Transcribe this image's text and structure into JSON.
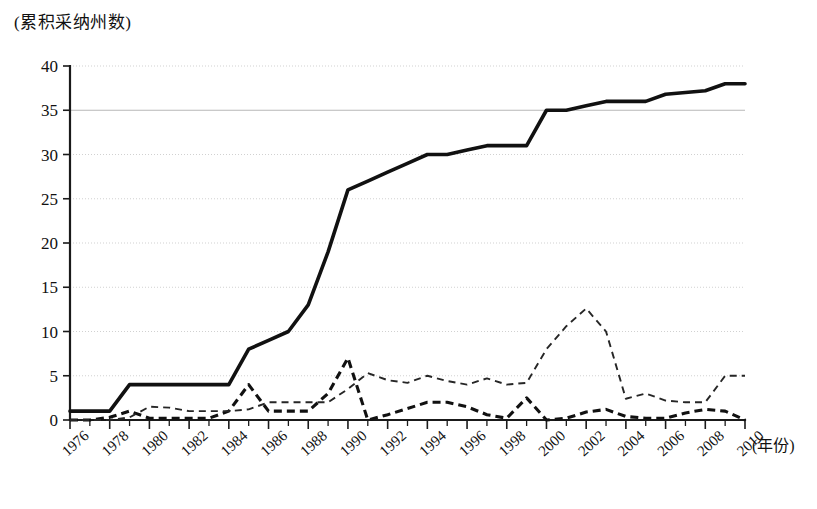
{
  "chart_data": {
    "type": "line",
    "title": "",
    "ylabel": "(累积采纳州数)",
    "xlabel": "(年份)",
    "ylim": [
      0,
      40
    ],
    "yticks": [
      0,
      5,
      10,
      15,
      20,
      25,
      30,
      35,
      40
    ],
    "xlim": [
      1976,
      2010
    ],
    "x": [
      1976,
      1977,
      1978,
      1979,
      1980,
      1981,
      1982,
      1983,
      1984,
      1985,
      1986,
      1987,
      1988,
      1989,
      1990,
      1991,
      1992,
      1993,
      1994,
      1995,
      1996,
      1997,
      1998,
      1999,
      2000,
      2001,
      2002,
      2003,
      2004,
      2005,
      2006,
      2007,
      2008,
      2009,
      2010
    ],
    "xticklabels": [
      "1976",
      "1978",
      "1980",
      "1982",
      "1984",
      "1986",
      "1988",
      "1990",
      "1992",
      "1994",
      "1996",
      "1998",
      "2000",
      "2002",
      "2004",
      "2006",
      "2008",
      "2010"
    ],
    "xticklabel_years": [
      1976,
      1978,
      1980,
      1982,
      1984,
      1986,
      1988,
      1990,
      1992,
      1994,
      1996,
      1998,
      2000,
      2002,
      2004,
      2006,
      2008,
      2010
    ],
    "grid": true,
    "legend_position": "none",
    "series": [
      {
        "name": "cumulative-adopting-states",
        "style": "solid-thick",
        "color": "#111111",
        "values": [
          1,
          1,
          1,
          4,
          4,
          4,
          4,
          4,
          4,
          8,
          9,
          10,
          13,
          19,
          26,
          27,
          28,
          29,
          30,
          30,
          30.5,
          31,
          31,
          31,
          35,
          35,
          35.5,
          36,
          36,
          36,
          36.8,
          37,
          37.2,
          38,
          38
        ]
      },
      {
        "name": "new-adoptions-bold",
        "style": "dashed-bold",
        "color": "#111111",
        "values": [
          0,
          0,
          0.3,
          1,
          0.2,
          0.2,
          0.2,
          0.2,
          1,
          4,
          1,
          1,
          1,
          3,
          7,
          0,
          0.6,
          1.3,
          2,
          2,
          1.5,
          0.6,
          0.2,
          2.5,
          0,
          0.2,
          0.9,
          1.2,
          0.4,
          0.2,
          0.2,
          0.8,
          1.2,
          1,
          0
        ]
      },
      {
        "name": "annual-count-thin",
        "style": "dashed-thin",
        "color": "#262626",
        "values": [
          0,
          0,
          0,
          0.3,
          1.5,
          1.4,
          1,
          1,
          1,
          1.2,
          2,
          2,
          2,
          2,
          3.5,
          5.3,
          4.5,
          4.2,
          5,
          4.4,
          4,
          4.7,
          4,
          4.2,
          8,
          10.6,
          12.6,
          10,
          2.4,
          3,
          2.2,
          2,
          2,
          5,
          5
        ]
      }
    ]
  },
  "axes": {
    "y_axis_caption": "(累积采纳州数)",
    "x_axis_caption": "(年份)"
  }
}
